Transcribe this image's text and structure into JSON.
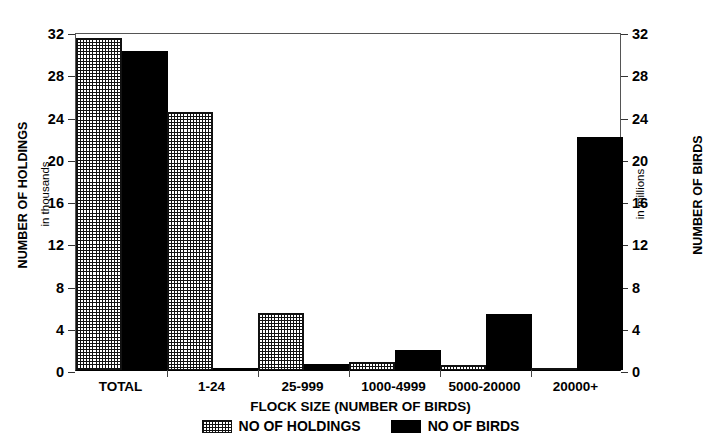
{
  "chart_data": {
    "type": "bar",
    "title": "",
    "xlabel": "FLOCK SIZE (NUMBER OF BIRDS)",
    "ylabel": "NUMBER OF HOLDINGS",
    "ylabel_sub": "in thousands",
    "y2label": "NUMBER OF BIRDS",
    "y2label_sub": "in millions",
    "categories": [
      "TOTAL",
      "1-24",
      "25-999",
      "1000-4999",
      "5000-20000",
      "20000+"
    ],
    "series": [
      {
        "name": "NO OF HOLDINGS",
        "axis": "left",
        "units": "thousands",
        "pattern": "cross-hatch",
        "color": "#111111",
        "values": [
          31.4,
          24.4,
          5.4,
          0.8,
          0.5,
          0.2
        ]
      },
      {
        "name": "NO OF BIRDS",
        "axis": "right",
        "units": "millions",
        "pattern": "solid",
        "color": "#000000",
        "values": [
          30.2,
          0.2,
          0.6,
          1.9,
          5.3,
          22.1
        ]
      }
    ],
    "ylim": [
      0,
      32
    ],
    "y2lim": [
      0,
      32
    ],
    "yticks": [
      0,
      4,
      8,
      12,
      16,
      20,
      24,
      28,
      32
    ],
    "y2ticks": [
      0,
      4,
      8,
      12,
      16,
      20,
      24,
      28,
      32
    ],
    "ytick_labels": [
      "0",
      "4",
      "8",
      "12",
      "16",
      "20",
      "24",
      "28",
      "32"
    ],
    "y2tick_labels": [
      "0",
      "4",
      "8",
      "12",
      "16",
      "20",
      "24",
      "28",
      "32"
    ],
    "grid": false,
    "legend_position": "bottom",
    "legend": [
      "NO OF HOLDINGS",
      "NO OF BIRDS"
    ]
  }
}
